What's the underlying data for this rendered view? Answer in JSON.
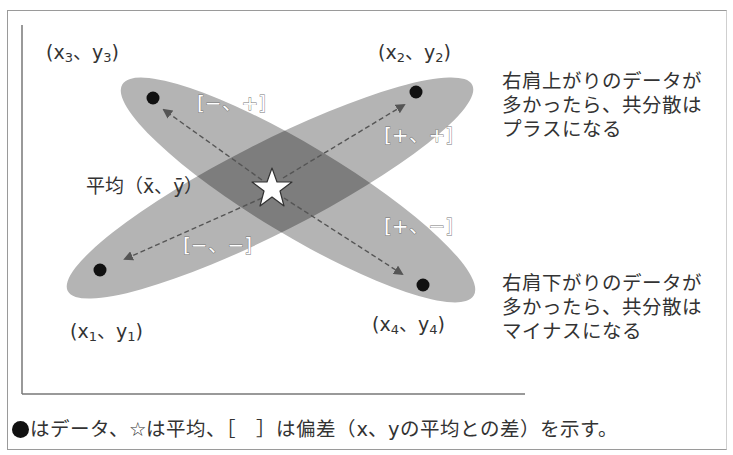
{
  "figure": {
    "title_cutoff": "図表1　共分散のイメージ",
    "points": [
      {
        "id": "p1",
        "label_open": "(x",
        "sub": "1",
        "sep": "、y",
        "sub2": "1",
        "close": ")",
        "deviation": "[−、−]"
      },
      {
        "id": "p2",
        "label_open": "(x",
        "sub": "2",
        "sep": "、y",
        "sub2": "2",
        "close": ")",
        "deviation": "[+、+]"
      },
      {
        "id": "p3",
        "label_open": "(x",
        "sub": "3",
        "sep": "、y",
        "sub2": "3",
        "close": ")",
        "deviation": "[−、+]"
      },
      {
        "id": "p4",
        "label_open": "(x",
        "sub": "4",
        "sep": "、y",
        "sub2": "4",
        "close": ")",
        "deviation": "[+、−]"
      }
    ],
    "mean_label": "平均（x̄、ȳ）",
    "notes": {
      "positive": [
        "右肩上がりのデータが",
        "多かったら、共分散は",
        "プラスになる"
      ],
      "negative": [
        "右肩下がりのデータが",
        "多かったら、共分散は",
        "マイナスになる"
      ]
    },
    "caption": "はデータ、☆は平均、［　］は偏差（x、yの平均との差）を示す。",
    "colors": {
      "ellipse": "#b4b4b4",
      "overlap": "#7d7d7d",
      "dot": "#111111",
      "arrow": "#555555",
      "frame": "#9a9a9a"
    }
  }
}
